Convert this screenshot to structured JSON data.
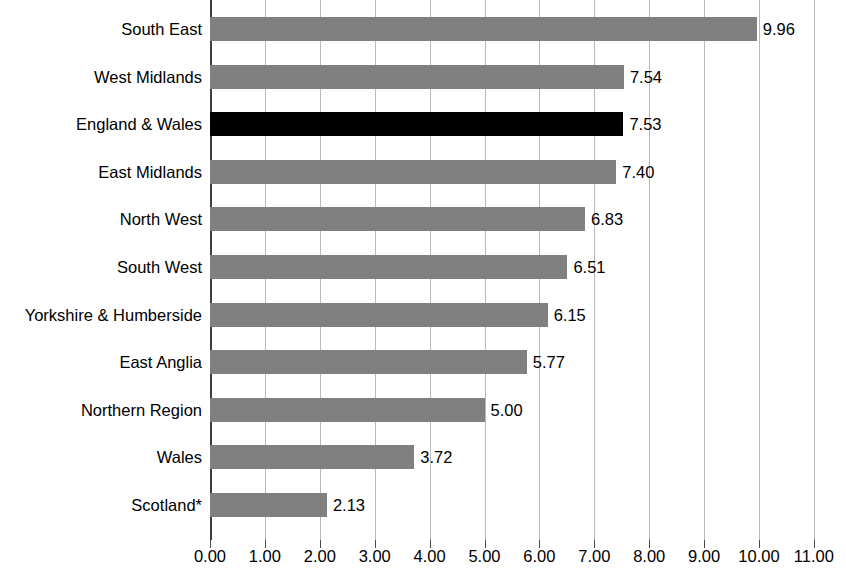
{
  "chart_data": {
    "type": "bar",
    "orientation": "horizontal",
    "title": "",
    "subtitle": "",
    "xlabel": "",
    "ylabel": "",
    "xlim": [
      0,
      11
    ],
    "grid": true,
    "legend": null,
    "highlight_category": "England & Wales",
    "highlight_color": "#000000",
    "bar_color": "#808080",
    "gridline_color": "#b9b9b9",
    "axis_color": "#3d3d3d",
    "categories": [
      "South East",
      "West Midlands",
      "England & Wales",
      "East Midlands",
      "North West",
      "South West",
      "Yorkshire & Humberside",
      "East Anglia",
      "Northern Region",
      "Wales",
      "Scotland*"
    ],
    "values": [
      9.96,
      7.54,
      7.53,
      7.4,
      6.83,
      6.51,
      6.15,
      5.77,
      5.0,
      3.72,
      2.13
    ],
    "value_labels": [
      "9.96",
      "7.54",
      "7.53",
      "7.40",
      "6.83",
      "6.51",
      "6.15",
      "5.77",
      "5.00",
      "3.72",
      "2.13"
    ],
    "xticks": [
      0,
      1,
      2,
      3,
      4,
      5,
      6,
      7,
      8,
      9,
      10,
      11
    ],
    "xtick_labels": [
      "0.00",
      "1.00",
      "2.00",
      "3.00",
      "4.00",
      "5.00",
      "6.00",
      "7.00",
      "8.00",
      "9.00",
      "10.00",
      "11.00"
    ]
  }
}
